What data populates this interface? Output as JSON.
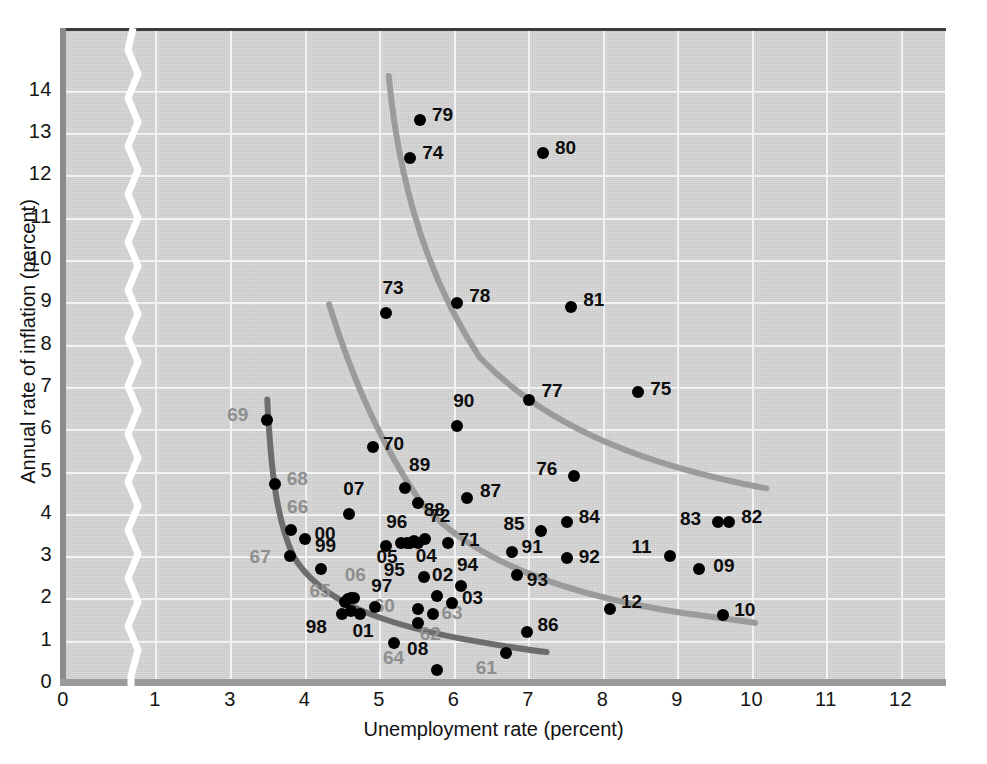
{
  "chart_data": {
    "type": "scatter",
    "title": "",
    "xlabel": "Unemployment rate (percent)",
    "ylabel": "Annual rate of inflation (percent)",
    "xlim": [
      0,
      12.6
    ],
    "ylim": [
      0,
      14.6
    ],
    "xticks": [
      "0",
      "1",
      "3",
      "4",
      "5",
      "6",
      "7",
      "8",
      "9",
      "10",
      "11",
      "12"
    ],
    "xtick_values": [
      0,
      1,
      3,
      4,
      5,
      6,
      7,
      8,
      9,
      10,
      11,
      12
    ],
    "yticks": [
      "0",
      "1",
      "2",
      "3",
      "4",
      "5",
      "6",
      "7",
      "8",
      "9",
      "10",
      "11",
      "12",
      "13",
      "14"
    ],
    "ytick_values": [
      0,
      1,
      2,
      3,
      4,
      5,
      6,
      7,
      8,
      9,
      10,
      11,
      12,
      13,
      14
    ],
    "axis_break": {
      "between": [
        1,
        3
      ],
      "style": "white-zigzag"
    },
    "grid": true,
    "legend": "none",
    "point_color": "#000000",
    "label_color_dark": "#0d0d0d",
    "label_color_grey": "#8f8f8f",
    "curve_color_dark": "#6d6d6d",
    "curve_color_light": "#9b9b9b",
    "background_color": "#d7d7d7",
    "points": [
      {
        "label": "61",
        "x": 6.7,
        "y": 0.7,
        "lx": -30,
        "ly": 14,
        "tone": "grey"
      },
      {
        "label": "08",
        "x": 5.78,
        "y": 0.3,
        "lx": -30,
        "ly": -22,
        "tone": "dark"
      },
      {
        "label": "64",
        "x": 5.2,
        "y": 0.95,
        "lx": -11,
        "ly": 14,
        "tone": "grey"
      },
      {
        "label": "62",
        "x": 5.52,
        "y": 1.42,
        "lx": 2,
        "ly": 10,
        "tone": "grey"
      },
      {
        "label": "63",
        "x": 5.73,
        "y": 1.62,
        "lx": 8,
        "ly": -2,
        "tone": "grey"
      },
      {
        "label": "60",
        "x": 5.52,
        "y": 1.75,
        "lx": -44,
        "ly": -4,
        "tone": "grey"
      },
      {
        "label": "86",
        "x": 6.98,
        "y": 1.2,
        "lx": 11,
        "ly": -8,
        "tone": "dark"
      },
      {
        "label": "98",
        "x": 4.5,
        "y": 1.62,
        "lx": -36,
        "ly": 12,
        "tone": "dark"
      },
      {
        "label": "01",
        "x": 4.75,
        "y": 1.62,
        "lx": -8,
        "ly": 16,
        "tone": "dark"
      },
      {
        "label": "97",
        "x": 4.95,
        "y": 1.8,
        "lx": -4,
        "ly": -22,
        "tone": "dark"
      },
      {
        "label": "65",
        "x": 4.55,
        "y": 1.92,
        "lx": -36,
        "ly": -12,
        "tone": "grey"
      },
      {
        "label": "06",
        "x": 4.62,
        "y": 2.0,
        "lx": -6,
        "ly": -24,
        "tone": "grey"
      },
      {
        "label": "03",
        "x": 5.98,
        "y": 1.9,
        "lx": 10,
        "ly": -6,
        "tone": "dark"
      },
      {
        "label": "02",
        "x": 5.78,
        "y": 2.05,
        "lx": -5,
        "ly": -22,
        "tone": "dark"
      },
      {
        "label": "94",
        "x": 6.1,
        "y": 2.3,
        "lx": -4,
        "ly": -22,
        "tone": "dark"
      },
      {
        "label": "95",
        "x": 5.6,
        "y": 2.5,
        "lx": -40,
        "ly": -8,
        "tone": "dark"
      },
      {
        "label": "93",
        "x": 6.85,
        "y": 2.55,
        "lx": 10,
        "ly": 4,
        "tone": "dark"
      },
      {
        "label": "09",
        "x": 9.3,
        "y": 2.7,
        "lx": 14,
        "ly": -4,
        "tone": "dark"
      },
      {
        "label": "99",
        "x": 4.22,
        "y": 2.7,
        "lx": -6,
        "ly": -24,
        "tone": "dark"
      },
      {
        "label": "67",
        "x": 3.8,
        "y": 3.0,
        "lx": -40,
        "ly": 0,
        "tone": "grey"
      },
      {
        "label": "11",
        "x": 8.9,
        "y": 3.0,
        "lx": -38,
        "ly": -10,
        "tone": "dark"
      },
      {
        "label": "05",
        "x": 5.1,
        "y": 3.25,
        "lx": -10,
        "ly": 10,
        "tone": "dark"
      },
      {
        "label": "04",
        "x": 5.52,
        "y": 3.3,
        "lx": -2,
        "ly": 12,
        "tone": "dark"
      },
      {
        "label": "96",
        "x": 5.42,
        "y": 3.32,
        "lx": -24,
        "ly": -22,
        "tone": "dark"
      },
      {
        "label": "91",
        "x": 6.78,
        "y": 3.1,
        "lx": 10,
        "ly": -6,
        "tone": "dark"
      },
      {
        "label": "92",
        "x": 7.52,
        "y": 2.95,
        "lx": 12,
        "ly": -2,
        "tone": "dark"
      },
      {
        "label": "10",
        "x": 9.62,
        "y": 1.6,
        "lx": 11,
        "ly": -6,
        "tone": "dark"
      },
      {
        "label": "12",
        "x": 8.1,
        "y": 1.75,
        "lx": 11,
        "ly": -8,
        "tone": "dark"
      },
      {
        "label": "71",
        "x": 5.92,
        "y": 3.3,
        "lx": 11,
        "ly": -4,
        "tone": "dark"
      },
      {
        "label": "72",
        "x": 5.62,
        "y": 3.4,
        "lx": 4,
        "ly": -24,
        "tone": "dark"
      },
      {
        "label": "00",
        "x": 4.0,
        "y": 3.4,
        "lx": 10,
        "ly": -6,
        "tone": "dark"
      },
      {
        "label": "66",
        "x": 3.82,
        "y": 3.62,
        "lx": -4,
        "ly": -24,
        "tone": "grey"
      },
      {
        "label": "85",
        "x": 7.18,
        "y": 3.6,
        "lx": -38,
        "ly": -8,
        "tone": "dark"
      },
      {
        "label": "84",
        "x": 7.52,
        "y": 3.8,
        "lx": 12,
        "ly": -6,
        "tone": "dark"
      },
      {
        "label": "83",
        "x": 9.55,
        "y": 3.8,
        "lx": -38,
        "ly": -4,
        "tone": "dark"
      },
      {
        "label": "82",
        "x": 9.7,
        "y": 3.8,
        "lx": 12,
        "ly": -6,
        "tone": "dark"
      },
      {
        "label": "07",
        "x": 4.6,
        "y": 4.0,
        "lx": -6,
        "ly": -26,
        "tone": "dark"
      },
      {
        "label": "88",
        "x": 5.52,
        "y": 4.25,
        "lx": 6,
        "ly": 6,
        "tone": "dark"
      },
      {
        "label": "87",
        "x": 6.18,
        "y": 4.38,
        "lx": 13,
        "ly": -8,
        "tone": "dark"
      },
      {
        "label": "89",
        "x": 5.35,
        "y": 4.6,
        "lx": 4,
        "ly": -24,
        "tone": "dark"
      },
      {
        "label": "68",
        "x": 3.6,
        "y": 4.7,
        "lx": 12,
        "ly": -6,
        "tone": "grey"
      },
      {
        "label": "76",
        "x": 7.62,
        "y": 4.9,
        "lx": -38,
        "ly": -8,
        "tone": "dark"
      },
      {
        "label": "70",
        "x": 4.92,
        "y": 5.58,
        "lx": 10,
        "ly": -4,
        "tone": "dark"
      },
      {
        "label": "90",
        "x": 6.05,
        "y": 6.08,
        "lx": -4,
        "ly": -26,
        "tone": "dark"
      },
      {
        "label": "69",
        "x": 3.5,
        "y": 6.22,
        "lx": -40,
        "ly": -6,
        "tone": "grey"
      },
      {
        "label": "77",
        "x": 7.02,
        "y": 6.7,
        "lx": 12,
        "ly": -10,
        "tone": "dark"
      },
      {
        "label": "75",
        "x": 8.48,
        "y": 6.88,
        "lx": 12,
        "ly": -4,
        "tone": "dark"
      },
      {
        "label": "73",
        "x": 5.1,
        "y": 8.75,
        "lx": -4,
        "ly": -26,
        "tone": "dark"
      },
      {
        "label": "81",
        "x": 7.58,
        "y": 8.9,
        "lx": 12,
        "ly": -8,
        "tone": "dark"
      },
      {
        "label": "78",
        "x": 6.05,
        "y": 8.98,
        "lx": 12,
        "ly": -8,
        "tone": "dark"
      },
      {
        "label": "74",
        "x": 5.42,
        "y": 12.42,
        "lx": 12,
        "ly": -6,
        "tone": "dark"
      },
      {
        "label": "80",
        "x": 7.2,
        "y": 12.52,
        "lx": 12,
        "ly": -6,
        "tone": "dark"
      },
      {
        "label": "79",
        "x": 5.55,
        "y": 13.32,
        "lx": 12,
        "ly": -6,
        "tone": "dark"
      }
    ],
    "extra_dots": [
      {
        "x": 5.3,
        "y": 3.3
      },
      {
        "x": 5.38,
        "y": 3.32
      },
      {
        "x": 5.47,
        "y": 3.35
      },
      {
        "x": 4.58,
        "y": 1.98
      },
      {
        "x": 4.66,
        "y": 2.02
      },
      {
        "x": 4.62,
        "y": 1.7
      }
    ],
    "curves": [
      {
        "name": "phillips-curve-1960s",
        "tone": "dark",
        "description": "Short-run Phillips curve fitted to 1960s observations",
        "path": "M 3.50,6.70 C 3.55,5.00 3.62,3.90 3.85,3.00 C 4.20,1.95 5.00,1.42 6.10,1.05 C 6.70,0.86 7.00,0.78 7.25,0.73"
      },
      {
        "name": "phillips-curve-1970s",
        "tone": "light",
        "description": "Short-run Phillips curve shifted out for the 1970s",
        "path": "M 4.33,8.95 C 4.62,7.30 5.00,5.70 5.55,4.30 C 6.25,2.85 7.60,2.05 9.10,1.65 C 9.55,1.55 9.85,1.47 10.05,1.42"
      },
      {
        "name": "phillips-curve-1980s",
        "tone": "light",
        "description": "Short-run Phillips curve shifted farthest out for the early 1980s",
        "path": "M 5.13,14.35 C 5.25,12.10 5.60,9.70 6.35,7.70 C 7.30,5.95 8.70,5.10 10.20,4.60"
      }
    ]
  }
}
